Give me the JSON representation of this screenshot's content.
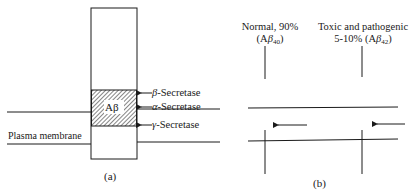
{
  "panel_a": {
    "caption": "(a)",
    "segment_label": "Aβ",
    "membrane_label": "Plasma membrane",
    "cleavage_sites": [
      {
        "greek": "β",
        "name": "-Secretase"
      },
      {
        "greek": "α",
        "name": "-Secretase"
      },
      {
        "greek": "γ",
        "name": "-Secretase"
      }
    ]
  },
  "panel_b": {
    "caption": "(b)",
    "product_left": {
      "line1": "Normal, 90%",
      "line2_prefix": "(A",
      "greek": "β",
      "sub": "40",
      "line2_suffix": ")"
    },
    "product_right": {
      "line1": "Toxic and pathogenic",
      "line2_prefix": "5-10% (A",
      "greek": "β",
      "sub": "42",
      "line2_suffix": ")"
    }
  },
  "colors": {
    "ink": "#1a1a1a",
    "background": "#ffffff"
  }
}
